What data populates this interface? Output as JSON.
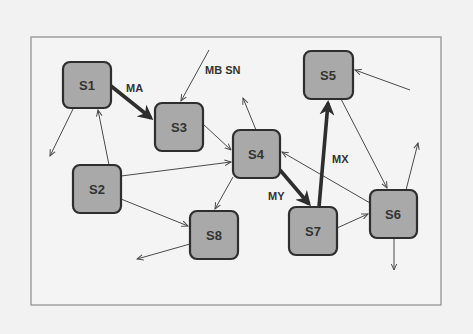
{
  "diagram": {
    "type": "state-transition-graph",
    "colors": {
      "background": "#f2f2f2",
      "frame": "#8a8a8a",
      "node_fill": "#a9a9a9",
      "node_stroke": "#2e2e2e",
      "edge": "#4a4a4a"
    },
    "nodes": [
      {
        "id": "S1",
        "label": "S1",
        "x": 63,
        "y": 62,
        "w": 48,
        "h": 46
      },
      {
        "id": "S2",
        "label": "S2",
        "x": 73,
        "y": 165,
        "w": 48,
        "h": 48
      },
      {
        "id": "S3",
        "label": "S3",
        "x": 155,
        "y": 103,
        "w": 48,
        "h": 48
      },
      {
        "id": "S4",
        "label": "S4",
        "x": 233,
        "y": 130,
        "w": 47,
        "h": 48
      },
      {
        "id": "S5",
        "label": "S5",
        "x": 304,
        "y": 51,
        "w": 49,
        "h": 48
      },
      {
        "id": "S6",
        "label": "S6",
        "x": 370,
        "y": 190,
        "w": 47,
        "h": 48
      },
      {
        "id": "S7",
        "label": "S7",
        "x": 289,
        "y": 207,
        "w": 48,
        "h": 48
      },
      {
        "id": "S8",
        "label": "S8",
        "x": 190,
        "y": 211,
        "w": 48,
        "h": 48
      }
    ],
    "edges": [
      {
        "from": "S1",
        "to": "S3",
        "label": "MA",
        "bold": true
      },
      {
        "from": "external",
        "to": "S3",
        "label": "MB SN",
        "bold": false
      },
      {
        "from": "S1",
        "to": "external",
        "label": "",
        "bold": false
      },
      {
        "from": "S2",
        "to": "S1",
        "label": "",
        "bold": false
      },
      {
        "from": "S2",
        "to": "S4",
        "label": "",
        "bold": false
      },
      {
        "from": "S2",
        "to": "S8",
        "label": "",
        "bold": false
      },
      {
        "from": "S3",
        "to": "S4",
        "label": "",
        "bold": false
      },
      {
        "from": "S4",
        "to": "external",
        "label": "",
        "bold": false
      },
      {
        "from": "S4",
        "to": "S8",
        "label": "",
        "bold": false
      },
      {
        "from": "S4",
        "to": "S7",
        "label": "MY",
        "bold": true
      },
      {
        "from": "S6",
        "to": "S4",
        "label": "",
        "bold": false
      },
      {
        "from": "S7",
        "to": "S5",
        "label": "MX",
        "bold": true
      },
      {
        "from": "S7",
        "to": "S6",
        "label": "",
        "bold": false
      },
      {
        "from": "S5",
        "to": "S6",
        "label": "",
        "bold": false
      },
      {
        "from": "external",
        "to": "S5",
        "label": "",
        "bold": false
      },
      {
        "from": "S6",
        "to": "external",
        "label": "",
        "bold": false
      },
      {
        "from": "S6",
        "to": "external",
        "label": "",
        "bold": false
      },
      {
        "from": "S8",
        "to": "external",
        "label": "",
        "bold": false
      }
    ],
    "edge_labels": {
      "MA": "MA",
      "MB_SN": "MB SN",
      "MY": "MY",
      "MX": "MX"
    }
  }
}
